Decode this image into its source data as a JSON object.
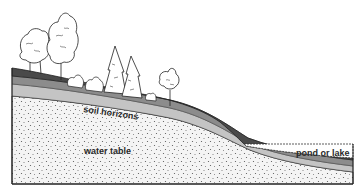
{
  "diagram": {
    "labels": {
      "soil_horizons": "soil horizons",
      "water_table": "water table",
      "pond_or_lake": "pond or lake"
    },
    "elements": {
      "deciduous_trees": 3,
      "shrubs": 3,
      "conifer_trees": 2,
      "small_tree": 1
    },
    "colors": {
      "topsoil": "#4a4a4a",
      "middle_horizon": "#8a8a8a",
      "lower_horizon": "#bdbdbd",
      "bedrock_sediment": "#f2f2f2",
      "outline": "#222222",
      "water": "#ffffff"
    }
  }
}
